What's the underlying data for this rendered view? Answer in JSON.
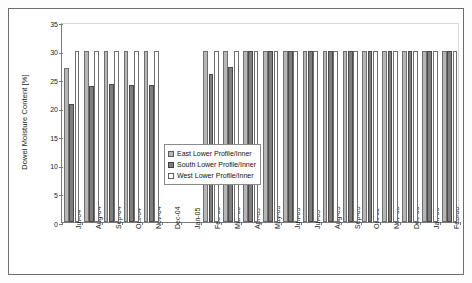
{
  "chart_data": {
    "type": "bar",
    "title": "",
    "xlabel": "",
    "ylabel": "Dowel Moisture Content [%]",
    "ylim": [
      0,
      35
    ],
    "yticks": [
      0,
      5,
      10,
      15,
      20,
      25,
      30,
      35
    ],
    "grid": false,
    "legend_position": "center",
    "categories": [
      "Jul-04",
      "Aug-04",
      "Sep-04",
      "Oct-04",
      "Nov-04",
      "Dec-04",
      "Jan-05",
      "Feb-05",
      "Mar-05",
      "Apr-05",
      "May-05",
      "Jun-05",
      "Jul-05",
      "Aug-05",
      "Sep-05",
      "Oct-05",
      "Nov-05",
      "Dec-05",
      "Jan-06",
      "Feb-06"
    ],
    "series": [
      {
        "name": "East Lower Profile/Inner",
        "color": "#b6b6b6",
        "values": [
          27.0,
          30,
          30,
          30,
          30,
          null,
          null,
          30,
          30,
          30,
          30,
          30,
          30,
          30,
          30,
          30,
          30,
          30,
          30,
          30
        ]
      },
      {
        "name": "South Lower Profile/Inner",
        "color": "#7e7e7e",
        "values": [
          20.6,
          23.8,
          24.1,
          24.0,
          24.0,
          null,
          null,
          25.9,
          27.2,
          30,
          30,
          30,
          30,
          30,
          30,
          30,
          30,
          30,
          30,
          30
        ]
      },
      {
        "name": "West Lower Profile/Inner",
        "color": "#ffffff",
        "values": [
          30,
          30,
          30,
          30,
          30,
          null,
          null,
          30,
          30,
          30,
          30,
          30,
          30,
          30,
          30,
          30,
          30,
          30,
          30,
          30
        ]
      }
    ]
  },
  "legend": {
    "items": [
      {
        "label": "East Lower Profile/Inner"
      },
      {
        "label": "South Lower Profile/Inner"
      },
      {
        "label": "West Lower Profile/Inner"
      }
    ]
  }
}
